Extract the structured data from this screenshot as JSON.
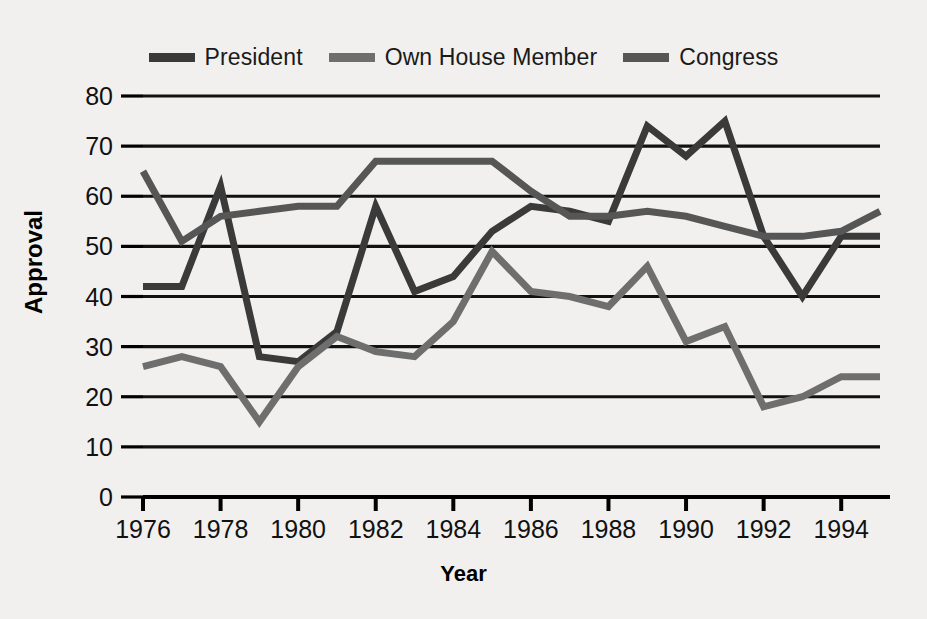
{
  "axes": {
    "ylabel": "Approval",
    "xlabel": "Year",
    "yticks": [
      "0",
      "10",
      "20",
      "30",
      "40",
      "50",
      "60",
      "70",
      "80"
    ],
    "xticks": [
      "1976",
      "1978",
      "1980",
      "1982",
      "1984",
      "1986",
      "1988",
      "1990",
      "1992",
      "1994"
    ]
  },
  "legend": {
    "items": [
      {
        "label": "President",
        "color": "#3a3a3a"
      },
      {
        "label": "Own House Member",
        "color": "#6e6e6e"
      },
      {
        "label": "Congress",
        "color": "#565656"
      }
    ]
  },
  "colors": {
    "background": "#f1f0ee",
    "gridline": "#111111",
    "axis": "#000000",
    "president": "#3a3a3a",
    "own_house_member": "#6e6e6e",
    "congress": "#565656"
  },
  "chart_data": {
    "type": "line",
    "title": "",
    "xlabel": "Year",
    "ylabel": "Approval",
    "xlim": [
      1976,
      1995
    ],
    "ylim": [
      0,
      80
    ],
    "grid": true,
    "legend_position": "top-center",
    "x": [
      1976,
      1977,
      1978,
      1979,
      1980,
      1981,
      1982,
      1983,
      1984,
      1985,
      1986,
      1987,
      1988,
      1989,
      1990,
      1991,
      1992,
      1993,
      1994,
      1995
    ],
    "series": [
      {
        "name": "President",
        "color": "#3a3a3a",
        "values": [
          42,
          42,
          62,
          28,
          27,
          33,
          58,
          41,
          44,
          53,
          58,
          57,
          55,
          74,
          68,
          75,
          52,
          40,
          52,
          52
        ]
      },
      {
        "name": "Own House Member",
        "color": "#6e6e6e",
        "values": [
          26,
          28,
          26,
          15,
          26,
          32,
          29,
          28,
          35,
          49,
          41,
          40,
          38,
          46,
          31,
          34,
          18,
          20,
          24,
          24
        ]
      },
      {
        "name": "Congress",
        "color": "#565656",
        "values": [
          65,
          51,
          56,
          57,
          58,
          58,
          67,
          67,
          67,
          67,
          61,
          56,
          56,
          57,
          56,
          54,
          52,
          52,
          53,
          57
        ]
      }
    ]
  }
}
